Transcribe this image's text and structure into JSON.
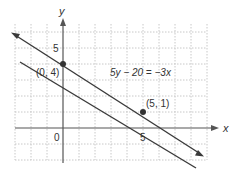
{
  "graph": {
    "x_axis_label": "x",
    "y_axis_label": "y",
    "origin_label": "0",
    "x_tick_label": "5",
    "y_tick_label": "5",
    "equation": "5y − 20 = −3x",
    "points": [
      {
        "label": "(0, 4)",
        "x": 0,
        "y": 4
      },
      {
        "label": "(5, 1)",
        "x": 5,
        "y": 1
      }
    ],
    "line_color": "#3a3a3a",
    "grid_color": "#c8c8c8",
    "axis_color": "#555555"
  }
}
